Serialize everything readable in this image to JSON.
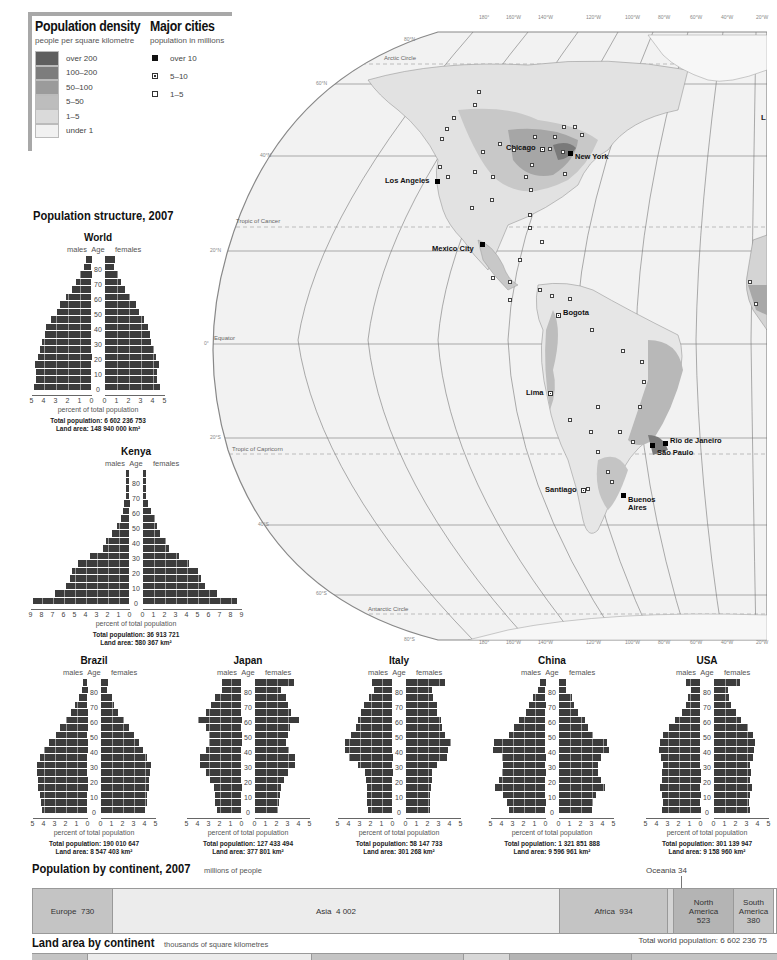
{
  "legend": {
    "density_title": "Population density",
    "density_subtitle": "people per square kilometre",
    "density_classes": [
      {
        "label": "over 200",
        "color": "#5f5f5f"
      },
      {
        "label": "100–200",
        "color": "#7d7d7d"
      },
      {
        "label": "50–100",
        "color": "#9b9b9b"
      },
      {
        "label": "5–50",
        "color": "#bdbdbd"
      },
      {
        "label": "1–5",
        "color": "#dadada"
      },
      {
        "label": "under 1",
        "color": "#f1f1f1"
      }
    ],
    "cities_title": "Major cities",
    "cities_subtitle": "population in millions",
    "city_classes": [
      {
        "label": "over 10",
        "symbol": "filled-square"
      },
      {
        "label": "5–10",
        "symbol": "dotted-square"
      },
      {
        "label": "1–5",
        "symbol": "open-square"
      }
    ]
  },
  "map": {
    "longitude_labels": [
      "180°",
      "160°W",
      "140°W",
      "120°W",
      "100°W",
      "80°W",
      "60°W",
      "40°W",
      "20°W"
    ],
    "latitude_labels": [
      "80°N",
      "60°N",
      "40°N",
      "20°N",
      "0°",
      "20°S",
      "40°S",
      "60°S",
      "80°S"
    ],
    "lines": {
      "arctic": "Arctic Circle",
      "cancer": "Tropic of Cancer",
      "equator": "Equator",
      "capricorn": "Tropic of Capricorn",
      "antarctic": "Antarctic Circle"
    },
    "cities": [
      {
        "name": "Chicago",
        "class": "5–10"
      },
      {
        "name": "New York",
        "class": "over 10"
      },
      {
        "name": "Los Angeles",
        "class": "over 10"
      },
      {
        "name": "Mexico City",
        "class": "over 10"
      },
      {
        "name": "Bogota",
        "class": "5–10"
      },
      {
        "name": "Lima",
        "class": "5–10"
      },
      {
        "name": "Rio de Janeiro",
        "class": "over 10"
      },
      {
        "name": "São Paulo",
        "class": "over 10"
      },
      {
        "name": "Santiago",
        "class": "5–10"
      },
      {
        "name": "Buenos Aires",
        "class": "over 10"
      }
    ],
    "edge_label": "L"
  },
  "population_structure": {
    "title": "Population structure, 2007",
    "labels": {
      "males": "males",
      "age": "Age",
      "females": "females",
      "xlabel": "percent of total population"
    },
    "age_ticks": [
      "0",
      "10",
      "20",
      "30",
      "40",
      "50",
      "60",
      "70",
      "80"
    ]
  },
  "chart_data": [
    {
      "type": "bar",
      "title": "World",
      "orientation": "population-pyramid",
      "categories": [
        "0-4",
        "5-9",
        "10-14",
        "15-19",
        "20-24",
        "25-29",
        "30-34",
        "35-39",
        "40-44",
        "45-49",
        "50-54",
        "55-59",
        "60-64",
        "65-69",
        "70-74",
        "75-79",
        "80-84",
        "85+"
      ],
      "series": [
        {
          "name": "males",
          "values": [
            4.8,
            4.6,
            4.6,
            4.7,
            4.5,
            4.3,
            4.1,
            3.9,
            3.8,
            3.4,
            2.9,
            2.6,
            2.1,
            1.6,
            1.3,
            1.0,
            0.6,
            0.5
          ]
        },
        {
          "name": "females",
          "values": [
            4.6,
            4.4,
            4.4,
            4.5,
            4.3,
            4.1,
            3.9,
            3.8,
            3.6,
            3.3,
            2.9,
            2.6,
            2.1,
            1.7,
            1.4,
            1.1,
            0.8,
            0.9
          ]
        }
      ],
      "xlim": [
        5,
        5
      ],
      "xlabel": "percent of total population",
      "ylabel": "Age",
      "total_population": "Total population: 6 602 236 753",
      "land_area": "Land area: 148 940 000 km²"
    },
    {
      "type": "bar",
      "title": "Kenya",
      "orientation": "population-pyramid",
      "categories": [
        "0-4",
        "5-9",
        "10-14",
        "15-19",
        "20-24",
        "25-29",
        "30-34",
        "35-39",
        "40-44",
        "45-49",
        "50-54",
        "55-59",
        "60-64",
        "65-69",
        "70-74",
        "75-79",
        "80-84",
        "85+"
      ],
      "series": [
        {
          "name": "males",
          "values": [
            8.8,
            6.8,
            5.8,
            5.4,
            5.2,
            4.7,
            3.6,
            2.4,
            2.1,
            1.6,
            1.1,
            0.8,
            0.6,
            0.5,
            0.3,
            0.3,
            0.3,
            0.3
          ]
        },
        {
          "name": "females",
          "values": [
            8.6,
            6.8,
            5.7,
            5.3,
            5.0,
            4.2,
            3.3,
            2.4,
            2.1,
            1.6,
            1.3,
            1.1,
            0.8,
            0.5,
            0.3,
            0.3,
            0.3,
            0.3
          ]
        }
      ],
      "xlim": [
        9,
        9
      ],
      "xlabel": "percent of total population",
      "ylabel": "Age",
      "total_population": "Total population: 36 913 721",
      "land_area": "Land area: 580 367 km²"
    },
    {
      "type": "bar",
      "title": "Brazil",
      "orientation": "population-pyramid",
      "categories": [
        "0-4",
        "5-9",
        "10-14",
        "15-19",
        "20-24",
        "25-29",
        "30-34",
        "35-39",
        "40-44",
        "45-49",
        "50-54",
        "55-59",
        "60-64",
        "65-69",
        "70-74",
        "75-79",
        "80-84",
        "85+"
      ],
      "series": [
        {
          "name": "males",
          "values": [
            4.1,
            4.2,
            4.3,
            4.5,
            4.5,
            4.6,
            4.6,
            4.3,
            4.0,
            3.5,
            2.9,
            2.5,
            2.0,
            1.5,
            1.1,
            0.8,
            0.5,
            0.4
          ]
        },
        {
          "name": "females",
          "values": [
            4.0,
            4.2,
            4.2,
            4.4,
            4.4,
            4.5,
            4.6,
            4.2,
            3.9,
            3.5,
            3.0,
            2.6,
            2.1,
            1.6,
            1.2,
            1.0,
            0.6,
            0.7
          ]
        }
      ],
      "xlim": [
        5,
        5
      ],
      "xlabel": "percent of total population",
      "ylabel": "Age",
      "total_population": "Total population: 190 010 647",
      "land_area": "Land area: 8 547 403 km²"
    },
    {
      "type": "bar",
      "title": "Japan",
      "orientation": "population-pyramid",
      "categories": [
        "0-4",
        "5-9",
        "10-14",
        "15-19",
        "20-24",
        "25-29",
        "30-34",
        "35-39",
        "40-44",
        "45-49",
        "50-54",
        "55-59",
        "60-64",
        "65-69",
        "70-74",
        "75-79",
        "80-84",
        "85+"
      ],
      "series": [
        {
          "name": "males",
          "values": [
            2.2,
            2.4,
            2.4,
            2.5,
            2.9,
            3.2,
            3.8,
            3.8,
            3.2,
            3.0,
            3.0,
            3.2,
            4.0,
            3.2,
            2.8,
            2.4,
            1.8,
            1.8
          ]
        },
        {
          "name": "females",
          "values": [
            2.1,
            2.2,
            2.3,
            2.4,
            2.7,
            3.0,
            3.7,
            3.7,
            3.1,
            2.9,
            3.0,
            3.2,
            4.0,
            3.3,
            3.0,
            2.9,
            2.4,
            3.6
          ]
        }
      ],
      "xlim": [
        5,
        5
      ],
      "xlabel": "percent of total population",
      "ylabel": "Age",
      "total_population": "Total population: 127 433 494",
      "land_area": "Land area: 377 801 km²"
    },
    {
      "type": "bar",
      "title": "Italy",
      "orientation": "population-pyramid",
      "categories": [
        "0-4",
        "5-9",
        "10-14",
        "15-19",
        "20-24",
        "25-29",
        "30-34",
        "35-39",
        "40-44",
        "45-49",
        "50-54",
        "55-59",
        "60-64",
        "65-69",
        "70-74",
        "75-79",
        "80-84",
        "85+"
      ],
      "series": [
        {
          "name": "males",
          "values": [
            2.2,
            2.3,
            2.3,
            2.3,
            2.4,
            2.5,
            3.1,
            4.0,
            4.3,
            4.3,
            3.8,
            3.3,
            3.1,
            2.9,
            2.6,
            2.1,
            1.7,
            1.9
          ]
        },
        {
          "name": "females",
          "values": [
            2.2,
            2.2,
            2.2,
            2.3,
            2.4,
            2.4,
            2.9,
            3.8,
            3.9,
            4.1,
            3.6,
            3.3,
            3.2,
            2.9,
            2.9,
            2.5,
            2.4,
            3.6
          ]
        }
      ],
      "xlim": [
        5,
        5
      ],
      "xlabel": "percent of total population",
      "ylabel": "Age",
      "total_population": "Total population: 58 147 733",
      "land_area": "Land area: 301 268 km²"
    },
    {
      "type": "bar",
      "title": "China",
      "orientation": "population-pyramid",
      "categories": [
        "0-4",
        "5-9",
        "10-14",
        "15-19",
        "20-24",
        "25-29",
        "30-34",
        "35-39",
        "40-44",
        "45-49",
        "50-54",
        "55-59",
        "60-64",
        "65-69",
        "70-74",
        "75-79",
        "80-84",
        "85+"
      ],
      "series": [
        {
          "name": "males",
          "values": [
            3.3,
            3.5,
            3.9,
            4.6,
            4.2,
            4.0,
            3.9,
            4.0,
            4.8,
            4.7,
            3.3,
            2.9,
            2.4,
            1.8,
            1.5,
            1.1,
            0.7,
            0.5
          ]
        },
        {
          "name": "females",
          "values": [
            3.0,
            3.1,
            3.4,
            4.2,
            3.9,
            3.6,
            3.6,
            3.9,
            4.6,
            4.4,
            3.1,
            2.7,
            2.4,
            1.8,
            1.4,
            1.2,
            0.7,
            0.7
          ]
        }
      ],
      "xlim": [
        5,
        5
      ],
      "xlabel": "percent of total population",
      "ylabel": "Age",
      "total_population": "Total population: 1 321 851 888",
      "land_area": "Land area: 9 596 961 km²"
    },
    {
      "type": "bar",
      "title": "USA",
      "orientation": "population-pyramid",
      "categories": [
        "0-4",
        "5-9",
        "10-14",
        "15-19",
        "20-24",
        "25-29",
        "30-34",
        "35-39",
        "40-44",
        "45-49",
        "50-54",
        "55-59",
        "60-64",
        "65-69",
        "70-74",
        "75-79",
        "80-84",
        "85+"
      ],
      "series": [
        {
          "name": "males",
          "values": [
            3.5,
            3.4,
            3.5,
            3.7,
            3.5,
            3.5,
            3.4,
            3.6,
            3.8,
            3.7,
            3.4,
            2.9,
            2.3,
            1.7,
            1.3,
            1.1,
            0.9,
            1.3
          ]
        },
        {
          "name": "females",
          "values": [
            3.3,
            3.2,
            3.3,
            3.5,
            3.3,
            3.4,
            3.3,
            3.6,
            3.7,
            3.8,
            3.6,
            3.1,
            2.5,
            2.0,
            1.6,
            1.4,
            1.3,
            2.4
          ]
        }
      ],
      "xlim": [
        5,
        5
      ],
      "xlabel": "percent of total population",
      "ylabel": "Age",
      "total_population": "Total population: 301 139 947",
      "land_area": "Land area: 9 158 960 km²"
    },
    {
      "type": "bar",
      "title": "Population by continent, 2007",
      "subtitle": "millions of people",
      "orientation": "stacked-horizontal",
      "categories": [
        "Europe",
        "Asia",
        "Africa",
        "Oceania",
        "North America",
        "South America"
      ],
      "values": [
        730,
        4002,
        934,
        34,
        523,
        380
      ],
      "footnote": "Total world population: 6 602 236 75…"
    }
  ],
  "continent_population": {
    "title": "Population by continent, 2007",
    "subtitle": "millions of people",
    "segments": [
      {
        "label": "Europe  730",
        "width": 80,
        "color": "#c4c4c4"
      },
      {
        "label": "Asia  4 002",
        "width": 447,
        "color": "#ececec"
      },
      {
        "label": "Africa  934",
        "width": 108,
        "color": "#c4c4c4"
      },
      {
        "label": "",
        "width": 6,
        "color": "#d4d4d4"
      },
      {
        "label": "North America 523",
        "width": 60,
        "color": "#b4b4b4"
      },
      {
        "label": "South America 380",
        "width": 40,
        "color": "#c4c4c4"
      }
    ],
    "oceania_callout": "Oceania  34",
    "north_america": [
      "North",
      "America",
      "523"
    ],
    "south_america": [
      "South",
      "America",
      "380"
    ],
    "footnote": "Total world population: 6 602 236 75"
  },
  "land_area": {
    "title": "Land area by continent",
    "subtitle": "thousands of square kilometres"
  }
}
